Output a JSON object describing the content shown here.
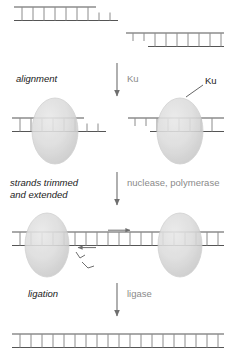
{
  "diagram": {
    "colors": {
      "strand": "#555555",
      "rung": "#8c8c8c",
      "protein_fill": "#d9d9d9",
      "protein_stroke": "#c0c0c0",
      "arrow": "#6e6e6e",
      "step_text": "#1a1a1a",
      "enzyme_text": "#8a8a8a"
    },
    "steps": [
      {
        "id": "alignment",
        "label": "alignment",
        "enzyme": "Ku"
      },
      {
        "id": "trimming",
        "label_line1": "strands trimmed",
        "label_line2": "and extended",
        "enzyme": "nuclease, polymerase"
      },
      {
        "id": "ligation",
        "label": "ligation",
        "enzyme": "ligase"
      }
    ],
    "annotations": {
      "ku_callout": "Ku"
    },
    "panels": [
      {
        "id": "panel-broken-ends",
        "description": "Two broken DNA duplex ends with incompatible overhangs",
        "molecules": [
          {
            "id": "left-end-5prime-overhang",
            "overhang": "5-prime",
            "base_pairs": 7
          },
          {
            "id": "right-end-3prime-overhang",
            "overhang": "3-prime",
            "base_pairs": 7
          }
        ]
      },
      {
        "id": "panel-ku-bound",
        "description": "Ku heterodimer bound to each DNA end, ends aligned",
        "molecules": [
          {
            "id": "left-end-ku",
            "overhang": "5-prime",
            "base_pairs": 7
          },
          {
            "id": "right-end-ku",
            "overhang": "3-prime",
            "base_pairs": 7
          }
        ]
      },
      {
        "id": "panel-trimmed-extended",
        "description": "Ends processed, gaps filled by polymerase, nicks remain",
        "marks": [
          "polymerase-arrow-right",
          "polymerase-arrow-left",
          "nick-mark-upper",
          "nick-mark-lower"
        ]
      },
      {
        "id": "panel-ligated",
        "description": "Continuous repaired DNA duplex after ligation",
        "base_pairs": 19
      }
    ]
  }
}
